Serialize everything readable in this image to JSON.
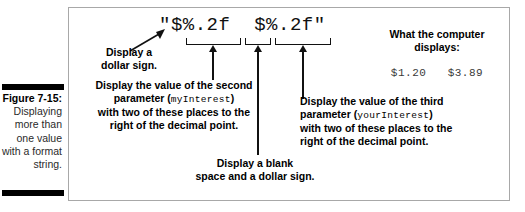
{
  "figure": {
    "caption_label": "Figure 7-15:",
    "caption_text": "Displaying more than one value with a format string.",
    "format_string": "\"$%.2f  $%.2f\""
  },
  "annotations": {
    "dollar_sign": {
      "line1": "Display a",
      "line2": "dollar sign."
    },
    "second_parameter": {
      "line1": "Display the value of the second",
      "line2_prefix": "parameter (",
      "line2_code": "myInterest",
      "line2_suffix": ")",
      "line3": "with two of these places to the",
      "line4": "right of the decimal point."
    },
    "blank_and_dollar": {
      "line1": "Display a blank",
      "line2": "space and a dollar sign."
    },
    "third_parameter": {
      "line1": "Display the value of the third",
      "line2_prefix": "parameter (",
      "line2_code": "yourInterest",
      "line2_suffix": ")",
      "line3": "with two of these places to the",
      "line4": "right of the decimal point."
    }
  },
  "computer_output": {
    "title_line1": "What the computer",
    "title_line2": "displays:",
    "value": "$1.20   $3.89"
  },
  "colors": {
    "ink": "#000000",
    "frame": "#a8a8a8",
    "code_gray": "#3a3a3a"
  }
}
